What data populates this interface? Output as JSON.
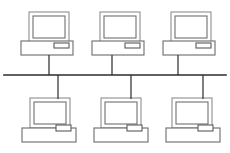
{
  "diagram": {
    "type": "network-topology-diagram",
    "topology": "bus",
    "node_count": 6,
    "canvas": {
      "width": 230,
      "height": 153,
      "background": "#ffffff"
    },
    "colors": {
      "background": "#ffffff",
      "bus_line": "#2b2b2b",
      "drop_cable": "#3a3a3a",
      "monitor_outline": "#8e8e8e",
      "screen_outline": "#6f6f6f",
      "base_outline": "#6b6b6b",
      "slot_outline": "#5a5a5a"
    },
    "bus": {
      "label": "bus-backbone",
      "y": 75,
      "x_start": 4,
      "x_end": 226,
      "stroke_width": 1.6
    },
    "nodes": [
      {
        "id": "computer-top-left",
        "label": "Computer 1",
        "row": "top",
        "column": 1,
        "icon": "desktop-computer-icon",
        "monitor": {
          "x": 29,
          "y": 12,
          "width": 40,
          "height": 30
        },
        "screen": {
          "x": 33,
          "y": 16,
          "width": 32,
          "height": 22
        },
        "legs": [
          {
            "x": 40,
            "y1": 42,
            "y2": 47
          },
          {
            "x": 58,
            "y1": 42,
            "y2": 47
          }
        ],
        "base": {
          "x": 21,
          "y": 41,
          "width": 52,
          "height": 14
        },
        "slot": {
          "x": 54,
          "y": 43,
          "width": 15,
          "height": 5
        },
        "cable": {
          "x": 49,
          "y1": 55,
          "y2": 75
        }
      },
      {
        "id": "computer-top-center",
        "label": "Computer 2",
        "row": "top",
        "column": 2,
        "icon": "desktop-computer-icon",
        "monitor": {
          "x": 100,
          "y": 12,
          "width": 40,
          "height": 30
        },
        "screen": {
          "x": 104,
          "y": 16,
          "width": 32,
          "height": 22
        },
        "legs": [
          {
            "x": 111,
            "y1": 42,
            "y2": 47
          },
          {
            "x": 129,
            "y1": 42,
            "y2": 47
          }
        ],
        "base": {
          "x": 92,
          "y": 41,
          "width": 52,
          "height": 14
        },
        "slot": {
          "x": 125,
          "y": 43,
          "width": 15,
          "height": 5
        },
        "cable": {
          "x": 112,
          "y1": 55,
          "y2": 75
        }
      },
      {
        "id": "computer-top-right",
        "label": "Computer 3",
        "row": "top",
        "column": 3,
        "icon": "desktop-computer-icon",
        "monitor": {
          "x": 171,
          "y": 12,
          "width": 40,
          "height": 30
        },
        "screen": {
          "x": 175,
          "y": 16,
          "width": 32,
          "height": 22
        },
        "legs": [
          {
            "x": 182,
            "y1": 42,
            "y2": 47
          },
          {
            "x": 200,
            "y1": 42,
            "y2": 47
          }
        ],
        "base": {
          "x": 163,
          "y": 41,
          "width": 52,
          "height": 14
        },
        "slot": {
          "x": 196,
          "y": 43,
          "width": 15,
          "height": 5
        },
        "cable": {
          "x": 178,
          "y1": 55,
          "y2": 75
        }
      },
      {
        "id": "computer-bottom-left",
        "label": "Computer 4",
        "row": "bottom",
        "column": 1,
        "icon": "desktop-computer-icon",
        "monitor": {
          "x": 30,
          "y": 98,
          "width": 40,
          "height": 30
        },
        "screen": {
          "x": 34,
          "y": 102,
          "width": 32,
          "height": 22
        },
        "legs": [
          {
            "x": 41,
            "y1": 128,
            "y2": 132
          },
          {
            "x": 59,
            "y1": 128,
            "y2": 132
          }
        ],
        "base": {
          "x": 22,
          "y": 128,
          "width": 54,
          "height": 14
        },
        "slot": {
          "x": 56,
          "y": 125,
          "width": 15,
          "height": 6
        },
        "cable": {
          "x": 58,
          "y1": 75,
          "y2": 99
        }
      },
      {
        "id": "computer-bottom-center",
        "label": "Computer 5",
        "row": "bottom",
        "column": 2,
        "icon": "desktop-computer-icon",
        "monitor": {
          "x": 101,
          "y": 98,
          "width": 40,
          "height": 30
        },
        "screen": {
          "x": 105,
          "y": 102,
          "width": 32,
          "height": 22
        },
        "legs": [
          {
            "x": 112,
            "y1": 128,
            "y2": 132
          },
          {
            "x": 130,
            "y1": 128,
            "y2": 132
          }
        ],
        "base": {
          "x": 94,
          "y": 128,
          "width": 54,
          "height": 14
        },
        "slot": {
          "x": 127,
          "y": 125,
          "width": 15,
          "height": 6
        },
        "cable": {
          "x": 131,
          "y1": 75,
          "y2": 99
        }
      },
      {
        "id": "computer-bottom-right",
        "label": "Computer 6",
        "row": "bottom",
        "column": 3,
        "icon": "desktop-computer-icon",
        "monitor": {
          "x": 172,
          "y": 98,
          "width": 40,
          "height": 30
        },
        "screen": {
          "x": 176,
          "y": 102,
          "width": 32,
          "height": 22
        },
        "legs": [
          {
            "x": 183,
            "y1": 128,
            "y2": 132
          },
          {
            "x": 201,
            "y1": 128,
            "y2": 132
          }
        ],
        "base": {
          "x": 166,
          "y": 128,
          "width": 54,
          "height": 14
        },
        "slot": {
          "x": 198,
          "y": 125,
          "width": 15,
          "height": 6
        },
        "cable": {
          "x": 203,
          "y1": 75,
          "y2": 99
        }
      }
    ]
  }
}
